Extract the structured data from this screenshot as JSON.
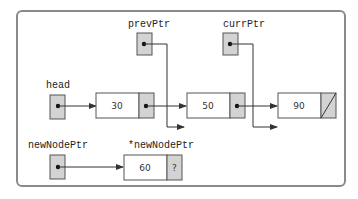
{
  "diagram": {
    "colors": {
      "frame": "#8a8a8a",
      "box_border": "#555555",
      "pointer_fill": "#d3d3d3",
      "node_fill": "#ffffff",
      "line": "#333333"
    },
    "labels": {
      "prevPtr": "prevPtr",
      "currPtr": "currPtr",
      "head": "head",
      "newNodePtr": "newNodePtr",
      "newNodeDeref": "*newNodePtr"
    },
    "nodes": [
      {
        "id": "node-30",
        "value": "30",
        "next": "pointer"
      },
      {
        "id": "node-50",
        "value": "50",
        "next": "pointer"
      },
      {
        "id": "node-90",
        "value": "90",
        "next": "null"
      },
      {
        "id": "node-60",
        "value": "60",
        "next": "?"
      }
    ],
    "pointers": [
      {
        "name": "head",
        "points_to": "node-30"
      },
      {
        "name": "prevPtr",
        "points_to": "node-50"
      },
      {
        "name": "currPtr",
        "points_to": "node-90"
      },
      {
        "name": "newNodePtr",
        "points_to": "node-60"
      }
    ]
  }
}
